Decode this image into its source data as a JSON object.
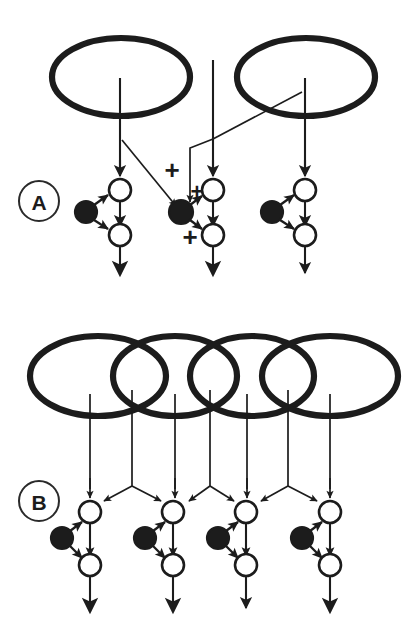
{
  "figure": {
    "background_color": "#ffffff",
    "ink_color": "#1c1c1c",
    "width": 411,
    "height": 636
  },
  "panels": [
    {
      "id": "A",
      "label": "A",
      "label_position": {
        "cx": 39,
        "cy": 201,
        "r": 20
      },
      "receptive_fields": [
        {
          "name": "ellipse-left",
          "cx": 121,
          "cy": 77,
          "rx": 69,
          "ry": 39
        },
        {
          "name": "ellipse-right",
          "cx": 306,
          "cy": 77,
          "rx": 69,
          "ry": 39
        }
      ],
      "vertical_inputs": [
        {
          "name": "input-line-left",
          "x": 120,
          "y_top": 78,
          "y_bottom": 176
        },
        {
          "name": "input-line-center",
          "x": 213,
          "y_top": 60,
          "y_bottom": 176
        },
        {
          "name": "input-line-right",
          "x": 305,
          "y_top": 78,
          "y_bottom": 176
        }
      ],
      "units": [
        {
          "name": "unit-left",
          "top_circle": {
            "cx": 120,
            "cy": 190,
            "r": 11
          },
          "filled_circle": {
            "cx": 86,
            "cy": 212,
            "r": 11
          },
          "bottom_circle": {
            "cx": 120,
            "cy": 235,
            "r": 11
          },
          "output_arrow": {
            "x": 120,
            "y_top": 246,
            "y_bottom": 277
          }
        },
        {
          "name": "unit-center",
          "top_circle": {
            "cx": 213,
            "cy": 190,
            "r": 11
          },
          "filled_circle": {
            "cx": 181,
            "cy": 212,
            "r": 12
          },
          "bottom_circle": {
            "cx": 213,
            "cy": 235,
            "r": 11
          },
          "output_arrow": {
            "x": 213,
            "y_top": 246,
            "y_bottom": 277
          }
        },
        {
          "name": "unit-right",
          "top_circle": {
            "cx": 305,
            "cy": 190,
            "r": 11
          },
          "filled_circle": {
            "cx": 272,
            "cy": 212,
            "r": 11
          },
          "bottom_circle": {
            "cx": 305,
            "cy": 235,
            "r": 11
          },
          "output_arrow": {
            "x": 305,
            "y_top": 246,
            "y_bottom": 277
          }
        }
      ],
      "lateral_connections": [
        {
          "name": "cross-from-left-field",
          "from": [
            122,
            140
          ],
          "to": [
            178,
            207
          ]
        },
        {
          "name": "cross-from-right-field",
          "from": [
            300,
            95
          ],
          "to": [
            213,
            140
          ]
        },
        {
          "name": "elbow-to-center-cell",
          "points": "213,140 190,148 190,205"
        }
      ],
      "plus_signs": [
        {
          "name": "plus-upper-left",
          "text": "+",
          "x": 172,
          "y": 170
        },
        {
          "name": "plus-mid-right",
          "text": "+",
          "x": 196,
          "y": 191
        },
        {
          "name": "plus-lower",
          "text": "+",
          "x": 190,
          "y": 236
        }
      ]
    },
    {
      "id": "B",
      "label": "B",
      "label_position": {
        "cx": 39,
        "cy": 501,
        "r": 20
      },
      "receptive_fields": [
        {
          "name": "ellipse-1",
          "cx": 98,
          "cy": 376,
          "rx": 68,
          "ry": 40
        },
        {
          "name": "ellipse-2",
          "cx": 175,
          "cy": 376,
          "rx": 62,
          "ry": 40
        },
        {
          "name": "ellipse-3",
          "cx": 252,
          "cy": 376,
          "rx": 62,
          "ry": 40
        },
        {
          "name": "ellipse-4",
          "cx": 330,
          "cy": 376,
          "rx": 68,
          "ry": 40
        }
      ],
      "vertical_inputs": [
        {
          "name": "input-line-1",
          "x": 90,
          "y_top": 394,
          "y_bottom": 492
        },
        {
          "name": "input-line-2",
          "x": 132,
          "y_top": 390,
          "y_bottom": 486
        },
        {
          "name": "input-line-3",
          "x": 175,
          "y_top": 394,
          "y_bottom": 492
        },
        {
          "name": "input-line-4",
          "x": 210,
          "y_top": 390,
          "y_bottom": 486
        },
        {
          "name": "input-line-5",
          "x": 247,
          "y_top": 394,
          "y_bottom": 492
        },
        {
          "name": "input-line-6",
          "x": 288,
          "y_top": 390,
          "y_bottom": 486
        },
        {
          "name": "input-line-7",
          "x": 330,
          "y_top": 394,
          "y_bottom": 492
        }
      ],
      "branch_points": [
        {
          "name": "branch-1",
          "apex": [
            132,
            486
          ],
          "left_target": [
            100,
            501
          ],
          "right_target": [
            165,
            501
          ]
        },
        {
          "name": "branch-2",
          "apex": [
            210,
            486
          ],
          "left_target": [
            185,
            501
          ],
          "right_target": [
            238,
            501
          ]
        },
        {
          "name": "branch-3",
          "apex": [
            288,
            486
          ],
          "left_target": [
            257,
            501
          ],
          "right_target": [
            320,
            501
          ]
        }
      ],
      "units": [
        {
          "name": "unit-1",
          "top_circle": {
            "cx": 90,
            "cy": 512,
            "r": 11
          },
          "filled_circle": {
            "cx": 62,
            "cy": 538,
            "r": 11
          },
          "bottom_circle": {
            "cx": 90,
            "cy": 565,
            "r": 11
          },
          "output_arrow": {
            "x": 90,
            "y_top": 576,
            "y_bottom": 614
          }
        },
        {
          "name": "unit-2",
          "top_circle": {
            "cx": 173,
            "cy": 512,
            "r": 11
          },
          "filled_circle": {
            "cx": 145,
            "cy": 538,
            "r": 11
          },
          "bottom_circle": {
            "cx": 173,
            "cy": 565,
            "r": 11
          },
          "output_arrow": {
            "x": 173,
            "y_top": 576,
            "y_bottom": 614
          }
        },
        {
          "name": "unit-3",
          "top_circle": {
            "cx": 246,
            "cy": 512,
            "r": 11
          },
          "filled_circle": {
            "cx": 218,
            "cy": 538,
            "r": 11
          },
          "bottom_circle": {
            "cx": 246,
            "cy": 565,
            "r": 11
          },
          "output_arrow": {
            "x": 246,
            "y_top": 576,
            "y_bottom": 610
          }
        },
        {
          "name": "unit-4",
          "top_circle": {
            "cx": 330,
            "cy": 512,
            "r": 11
          },
          "filled_circle": {
            "cx": 302,
            "cy": 538,
            "r": 11
          },
          "bottom_circle": {
            "cx": 330,
            "cy": 565,
            "r": 11
          },
          "output_arrow": {
            "x": 330,
            "y_top": 576,
            "y_bottom": 614
          }
        }
      ]
    }
  ],
  "legend": {
    "open_circle_meaning": "excitatory-interneuron",
    "filled_circle_meaning": "inhibitory-interneuron",
    "plus_meaning": "excitatory-synapse"
  }
}
